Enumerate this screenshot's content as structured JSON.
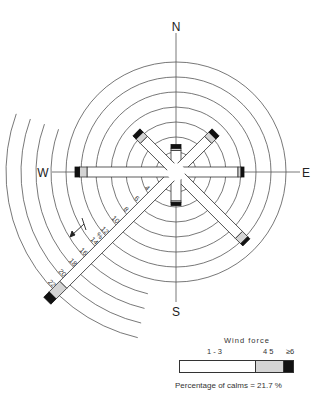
{
  "chart_data": {
    "type": "wind-rose",
    "title": "",
    "directions": [
      "N",
      "NE",
      "E",
      "SE",
      "S",
      "SW",
      "W",
      "NW"
    ],
    "compass_labels": {
      "N": "N",
      "E": "E",
      "S": "S",
      "W": "W"
    },
    "radial_unit": "%",
    "radial_ticks": [
      4,
      6,
      8,
      10,
      12,
      14,
      16,
      18,
      20,
      22
    ],
    "radial_tick_labels": [
      "4",
      "6",
      "8",
      "10",
      "12",
      "%",
      "14",
      "16",
      "18",
      "20",
      "22"
    ],
    "ring_values": [
      2,
      4,
      6,
      8,
      10,
      12,
      14,
      16,
      18,
      20,
      22
    ],
    "series": [
      {
        "direction": "N",
        "total_pct": 3.0,
        "force_1_3": 2.2,
        "force_4_5": 0.3,
        "force_6plus": 0.5
      },
      {
        "direction": "NE",
        "total_pct": 6.8,
        "force_1_3": 5.4,
        "force_4_5": 0.8,
        "force_6plus": 0.6
      },
      {
        "direction": "E",
        "total_pct": 8.4,
        "force_1_3": 7.6,
        "force_4_5": 0.4,
        "force_6plus": 0.4
      },
      {
        "direction": "SE",
        "total_pct": 12.6,
        "force_1_3": 11.2,
        "force_4_5": 1.0,
        "force_6plus": 0.4
      },
      {
        "direction": "S",
        "total_pct": 3.8,
        "force_1_3": 3.2,
        "force_4_5": 0.2,
        "force_6plus": 0.4
      },
      {
        "direction": "SW",
        "total_pct": 23.6,
        "force_1_3": 20.6,
        "force_4_5": 2.0,
        "force_6plus": 1.0
      },
      {
        "direction": "W",
        "total_pct": 12.8,
        "force_1_3": 11.2,
        "force_4_5": 1.0,
        "force_6plus": 0.6
      },
      {
        "direction": "NW",
        "total_pct": 6.8,
        "force_1_3": 5.4,
        "force_4_5": 0.8,
        "force_6plus": 0.6
      }
    ],
    "colors": {
      "force_1_3": "#ffffff",
      "force_4_5": "#d4d4d4",
      "force_6plus": "#111111",
      "lines": "#444444"
    }
  },
  "legend": {
    "title": "Wind   force",
    "scale_labels": {
      "low": "1 - 3",
      "mid": "4   5",
      "high": "≥6"
    },
    "segments": [
      {
        "name": "1-3",
        "width_pct": 68,
        "color": "#ffffff"
      },
      {
        "name": "4-5",
        "width_pct": 24,
        "color": "#d4d4d4"
      },
      {
        "name": ">=6",
        "width_pct": 8,
        "color": "#111111"
      }
    ],
    "calms_text": "Percentage of calms  =  21.7 %"
  }
}
